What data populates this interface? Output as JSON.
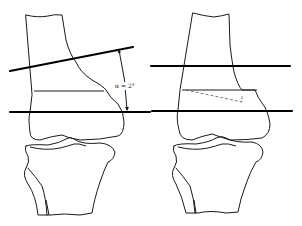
{
  "figure": {
    "panels": [
      {
        "id": "left",
        "description": "Pre-correction knee: femur and tibia with tilted joint-line reference and horizontal axis",
        "angle_label": "α = 2°"
      },
      {
        "id": "right",
        "description": "Post-correction knee: parallel horizontal reference lines with dashed wedge on distal femur"
      }
    ],
    "colors": {
      "line": "#1a1a1a",
      "background": "#ffffff",
      "dashed_wedge": "#555555"
    }
  }
}
